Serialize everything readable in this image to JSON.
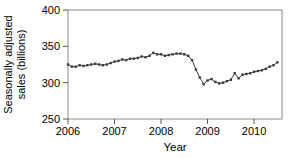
{
  "figure": {
    "background_color": "#ffffff",
    "frame_color": "#8a8a8a",
    "tick_color": "#555555",
    "text_color": "#000000",
    "line_color": "#3c3c3c",
    "marker_color": "#3c3c3c"
  },
  "chart_data": {
    "type": "line",
    "title": "",
    "xlabel": "Year",
    "ylabel": "Seasonally adjusted sales (billions)",
    "ylabel_lines": [
      "Seasonally adjusted",
      "sales (billions)"
    ],
    "xlim": [
      2006.0,
      2010.6
    ],
    "ylim": [
      250,
      400
    ],
    "xticks": [
      2006,
      2007,
      2008,
      2009,
      2010
    ],
    "yticks": [
      400,
      350,
      300,
      250
    ],
    "grid": false,
    "legend_position": "none",
    "frequency": "monthly",
    "series": [
      {
        "name": "Seasonally adjusted sales",
        "months": [
          "2006-01",
          "2006-02",
          "2006-03",
          "2006-04",
          "2006-05",
          "2006-06",
          "2006-07",
          "2006-08",
          "2006-09",
          "2006-10",
          "2006-11",
          "2006-12",
          "2007-01",
          "2007-02",
          "2007-03",
          "2007-04",
          "2007-05",
          "2007-06",
          "2007-07",
          "2007-08",
          "2007-09",
          "2007-10",
          "2007-11",
          "2007-12",
          "2008-01",
          "2008-02",
          "2008-03",
          "2008-04",
          "2008-05",
          "2008-06",
          "2008-07",
          "2008-08",
          "2008-09",
          "2008-10",
          "2008-11",
          "2008-12",
          "2009-01",
          "2009-02",
          "2009-03",
          "2009-04",
          "2009-05",
          "2009-06",
          "2009-07",
          "2009-08",
          "2009-09",
          "2009-10",
          "2009-11",
          "2009-12",
          "2010-01",
          "2010-02",
          "2010-03",
          "2010-04",
          "2010-05",
          "2010-06",
          "2010-07"
        ],
        "values": [
          325,
          322,
          322,
          324,
          323,
          324,
          325,
          326,
          325,
          324,
          325,
          327,
          329,
          330,
          332,
          331,
          333,
          333,
          334,
          336,
          335,
          337,
          341,
          339,
          339,
          337,
          338,
          339,
          340,
          340,
          339,
          337,
          331,
          318,
          307,
          298,
          303,
          305,
          301,
          299,
          300,
          302,
          304,
          313,
          306,
          311,
          312,
          313,
          315,
          316,
          317,
          319,
          322,
          324,
          328
        ]
      }
    ]
  }
}
